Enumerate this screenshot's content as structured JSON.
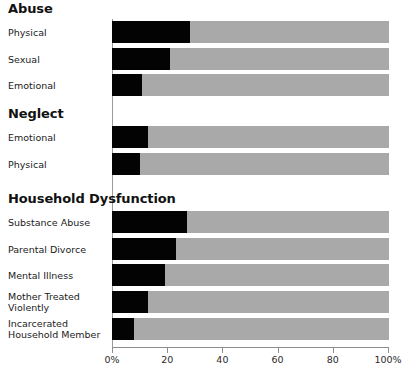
{
  "chart_data": {
    "type": "bar",
    "title": "",
    "orientation": "horizontal",
    "xlabel": "",
    "ylabel": "",
    "xlim": [
      0,
      100
    ],
    "grid": false,
    "legend": null,
    "axis": {
      "ticks": [
        0,
        20,
        40,
        60,
        80,
        100
      ],
      "tick_labels": [
        "0%",
        "20",
        "40",
        "60",
        "80",
        "100%"
      ]
    },
    "colors": {
      "fill": "#030303",
      "track": "#a9a9a9",
      "text": "#1b1b1b",
      "axis": "#8d8d8d"
    },
    "groups": [
      {
        "name": "Abuse",
        "categories": [
          "Physical",
          "Sexual",
          "Emotional"
        ],
        "values": [
          28,
          21,
          11
        ]
      },
      {
        "name": "Neglect",
        "categories": [
          "Emotional",
          "Physical"
        ],
        "values": [
          13,
          10
        ]
      },
      {
        "name": "Household Dysfunction",
        "categories": [
          "Substance Abuse",
          "Parental Divorce",
          "Mental Illness",
          "Mother Treated\nViolently",
          "Incarcerated\nHousehold Member"
        ],
        "values": [
          27,
          23,
          19,
          13,
          8
        ]
      }
    ]
  },
  "sections": {
    "abuse": {
      "heading": "Abuse",
      "rows": [
        {
          "label": "Physical",
          "value": 28
        },
        {
          "label": "Sexual",
          "value": 21
        },
        {
          "label": "Emotional",
          "value": 11
        }
      ]
    },
    "neglect": {
      "heading": "Neglect",
      "rows": [
        {
          "label": "Emotional",
          "value": 13
        },
        {
          "label": "Physical",
          "value": 10
        }
      ]
    },
    "household": {
      "heading": "Household Dysfunction",
      "rows": [
        {
          "label": "Substance Abuse",
          "value": 27
        },
        {
          "label": "Parental Divorce",
          "value": 23
        },
        {
          "label": "Mental Illness",
          "value": 19
        },
        {
          "label": "Mother Treated\nViolently",
          "value": 13
        },
        {
          "label": "Incarcerated\nHousehold Member",
          "value": 8
        }
      ]
    }
  },
  "axis": {
    "labels": [
      "0%",
      "20",
      "40",
      "60",
      "80",
      "100%"
    ]
  }
}
